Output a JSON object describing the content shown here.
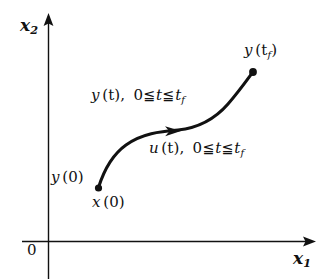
{
  "figure": {
    "name": "state-trajectory-diagram",
    "background_color": "#ffffff",
    "ink_color": "#111111"
  },
  "axes": {
    "x_axis": {
      "label_base": "x",
      "label_sub": "1",
      "arrow": "right-arrow-icon",
      "origin_label": "0"
    },
    "y_axis": {
      "label_base": "x",
      "label_sub": "2",
      "arrow": "up-arrow-icon"
    }
  },
  "curve": {
    "name": "state-trajectory-curve",
    "shape": "s-curve",
    "direction_marker": "arrowhead-icon",
    "start_point": {
      "marker": "filled-dot",
      "labels": [
        "y (0)",
        "x (0)"
      ]
    },
    "end_point": {
      "marker": "filled-dot",
      "label_base": "y",
      "label_arg": "(t",
      "label_sub": "f",
      "label_close": ")"
    }
  },
  "annotations": {
    "trajectory": {
      "func": "y",
      "arg": "(t)",
      "comma": ",",
      "lower": "0",
      "rel1": "≦",
      "var": "t",
      "rel2": "≦",
      "upper_base": "t",
      "upper_sub": "f"
    },
    "control": {
      "func": "u",
      "arg": "(t)",
      "comma": ",",
      "lower": "0",
      "rel1": "≦",
      "var": "t",
      "rel2": "≦",
      "upper_base": "t",
      "upper_sub": "f"
    }
  },
  "labels": {
    "y_final_base": "y",
    "y_final_open": "(t",
    "y_final_sub": "f",
    "y_final_close": ")",
    "y_initial_base": "y",
    "y_initial_arg": "(0)",
    "x_initial_base": "x",
    "x_initial_arg": "(0)"
  }
}
